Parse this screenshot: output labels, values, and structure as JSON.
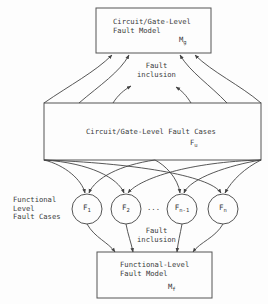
{
  "diagram": {
    "top_box": {
      "title_line1": "Circuit/Gate-Level",
      "title_line2": "Fault Model",
      "symbol": "M",
      "symbol_sub": "g"
    },
    "upper_label": {
      "line1": "Fault",
      "line2": "inclusion"
    },
    "middle_box": {
      "title": "Circuit/Gate-Level Fault Cases",
      "symbol": "F",
      "symbol_sub": "u"
    },
    "side_label": {
      "line1": "Functional",
      "line2": "Level",
      "line3": "Fault Cases"
    },
    "circles": [
      {
        "symbol": "F",
        "sub": "1"
      },
      {
        "symbol": "F",
        "sub": "2"
      },
      {
        "symbol": "F",
        "sub": "n-1"
      },
      {
        "symbol": "F",
        "sub": "n"
      }
    ],
    "ellipsis": "...",
    "lower_label": {
      "line1": "Fault",
      "line2": "inclusion"
    },
    "bottom_box": {
      "title_line1": "Functional-Level",
      "title_line2": "Fault Model",
      "symbol": "M",
      "symbol_sub": "f"
    },
    "colors": {
      "stroke": "#444444",
      "text": "#3a3a3a",
      "background": "#fdfdfd"
    }
  }
}
